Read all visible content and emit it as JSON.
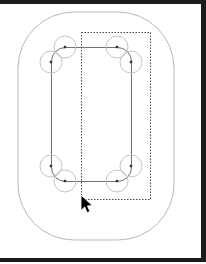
{
  "app": {
    "title": "Vector Canvas",
    "background_color": "#ffffff",
    "frame_color": "#1b1b1b"
  },
  "canvas": {
    "width": 206,
    "height": 264,
    "background_color": "#ffffff"
  },
  "shapes": {
    "outer_rounded_rect": {
      "label": "outer-stadium-shape",
      "x": 18,
      "y": 12,
      "width": 156,
      "height": 228,
      "rx": 56,
      "stroke_color": "#b9b9bd",
      "stroke_width": 1,
      "fill": "none"
    },
    "inner_rounded_rect": {
      "label": "selected-rounded-rect-path",
      "x": 51,
      "y": 47,
      "width": 80,
      "height": 134,
      "rx": 14,
      "stroke_color": "#6e6e74",
      "stroke_width": 1,
      "fill": "none"
    },
    "selection_box": {
      "label": "dashed-selection-bounds",
      "x": 81,
      "y": 32,
      "width": 69,
      "height": 167,
      "stroke_color": "#4a4a4a",
      "stroke_width": 1,
      "dash": "1.5 1.5",
      "fill": "none"
    }
  },
  "handles": {
    "circle_radius": 11,
    "circle_stroke_color": "#c3c3c8",
    "circle_fill": "none",
    "point_size": 2.4,
    "point_color": "#303036",
    "points": [
      {
        "name": "handle-top-left-upper",
        "cx": 65,
        "cy": 47
      },
      {
        "name": "handle-top-left-lower",
        "cx": 51,
        "cy": 62
      },
      {
        "name": "handle-top-right-upper",
        "cx": 117,
        "cy": 47
      },
      {
        "name": "handle-top-right-lower",
        "cx": 131,
        "cy": 62
      },
      {
        "name": "handle-bottom-left-upper",
        "cx": 51,
        "cy": 166
      },
      {
        "name": "handle-bottom-left-lower",
        "cx": 65,
        "cy": 181
      },
      {
        "name": "handle-bottom-right-upper",
        "cx": 131,
        "cy": 166
      },
      {
        "name": "handle-bottom-right-lower",
        "cx": 117,
        "cy": 181
      }
    ]
  },
  "cursor": {
    "name": "mouse-pointer",
    "x": 80,
    "y": 194,
    "width": 12,
    "height": 19,
    "fill_color": "#000000",
    "stroke_color": "#ffffff"
  }
}
